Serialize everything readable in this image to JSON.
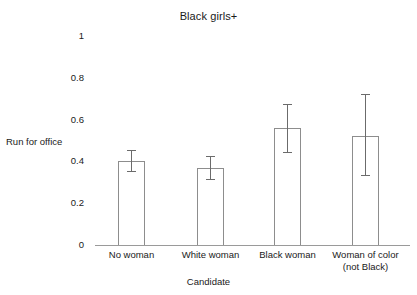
{
  "chart_data": {
    "type": "bar",
    "title": "Black girls+",
    "xlabel": "Candidate",
    "ylabel": "Run for office",
    "ylim": [
      0,
      1
    ],
    "grid": false,
    "legend": "none",
    "yticks": [
      "0",
      "0.2",
      "0.4",
      "0.6",
      "0.8",
      "1"
    ],
    "ytick_values": [
      0,
      0.2,
      0.4,
      0.6,
      0.8,
      1
    ],
    "categories": [
      "No woman",
      "White woman",
      "Black woman",
      "Woman of color (not Black)"
    ],
    "category_lines": [
      [
        "No woman"
      ],
      [
        "White woman"
      ],
      [
        "Black woman"
      ],
      [
        "Woman of color",
        "(not Black)"
      ]
    ],
    "values": [
      0.4,
      0.37,
      0.56,
      0.52
    ],
    "error_low": [
      0.35,
      0.31,
      0.44,
      0.33
    ],
    "error_high": [
      0.45,
      0.42,
      0.67,
      0.72
    ],
    "bar_color": "#ffffff",
    "bar_edge_color": "#8d8d8d",
    "error_color": "#6b6b6b",
    "axis_color": "#9a9a9a",
    "text_color": "#1a1a1a"
  }
}
